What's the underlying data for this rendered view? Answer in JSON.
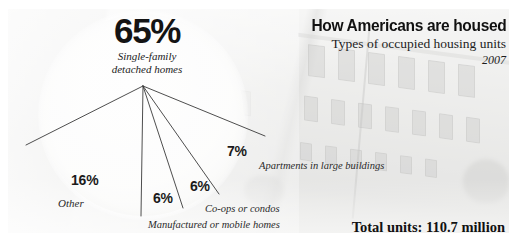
{
  "header": {
    "title": "How Americans are housed",
    "subtitle": "Types of occupied housing units",
    "year": "2007"
  },
  "footer": {
    "total": "Total units: 110.7 million"
  },
  "featured": {
    "value": "65%",
    "label": "Single-family\ndetached homes"
  },
  "labels": {
    "other_pct": "16%",
    "other_name": "Other",
    "manufactured_pct": "6%",
    "manufactured_name": "Manufactured or mobile homes",
    "coops_pct": "6%",
    "coops_name": "Co-ops or condos",
    "apartments_pct": "7%",
    "apartments_name": "Apartments in large buildings"
  },
  "colors": {
    "ink": "#141414",
    "pie_fill": "#fafaf9",
    "spoke": "#3a3a3a",
    "photo": "#d4d4d1"
  },
  "chart_data": {
    "type": "pie",
    "title": "How Americans are housed",
    "subtitle": "Types of occupied housing units",
    "year": "2007",
    "unit": "percent of occupied housing units",
    "total_label": "Total units: 110.7 million",
    "total_value": 110.7,
    "total_unit": "million units",
    "categories": [
      "Single-family detached homes",
      "Other",
      "Manufactured or mobile homes",
      "Co-ops or condos",
      "Apartments in large buildings"
    ],
    "values": [
      65,
      16,
      6,
      6,
      7
    ],
    "labels": [
      "65%",
      "16%",
      "6%",
      "6%",
      "7%"
    ],
    "legend": "none",
    "grid": false
  }
}
